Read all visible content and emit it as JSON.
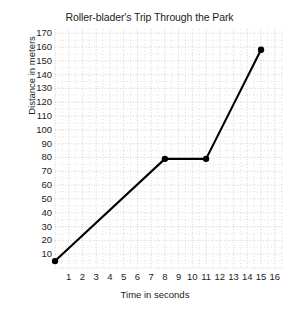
{
  "chart_data": {
    "type": "line",
    "title": "Roller-blader's Trip Through the Park",
    "xlabel": "Time in seconds",
    "ylabel": "Distance in meters",
    "x": [
      0,
      8,
      11,
      15
    ],
    "values": [
      5,
      79,
      79,
      158
    ],
    "points": [
      {
        "x": 0,
        "y": 5
      },
      {
        "x": 8,
        "y": 79
      },
      {
        "x": 11,
        "y": 79
      },
      {
        "x": 15,
        "y": 158
      }
    ],
    "xlim": [
      0,
      16.6
    ],
    "ylim": [
      0,
      173
    ],
    "xticks": [
      1,
      2,
      3,
      4,
      5,
      6,
      7,
      8,
      9,
      10,
      11,
      12,
      13,
      14,
      15,
      16
    ],
    "yticks": [
      10,
      20,
      30,
      40,
      50,
      60,
      70,
      80,
      90,
      100,
      110,
      120,
      130,
      140,
      150,
      160,
      170
    ],
    "xtick_labels": [
      "1",
      "2",
      "3",
      "4",
      "5",
      "6",
      "7",
      "8",
      "9",
      "10",
      "11",
      "12",
      "13",
      "14",
      "15",
      "16"
    ],
    "ytick_labels": [
      "10",
      "20",
      "30",
      "40",
      "50",
      "60",
      "70",
      "80",
      "90",
      "100",
      "110",
      "120",
      "130",
      "140",
      "150",
      "160",
      "170"
    ],
    "grid": true,
    "grid_style": "dotted",
    "grid_color": "#c9c9c9",
    "line_color": "#000000",
    "marker": "circle",
    "marker_color": "#000000",
    "legend": false
  }
}
